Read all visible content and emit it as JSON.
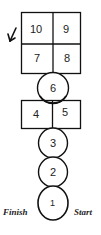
{
  "diagram": {
    "type": "hopscotch-court",
    "squares": [
      {
        "id": "10",
        "label": "10"
      },
      {
        "id": "9",
        "label": "9"
      },
      {
        "id": "7",
        "label": "7"
      },
      {
        "id": "8",
        "label": "8"
      },
      {
        "id": "4",
        "label": "4"
      },
      {
        "id": "5",
        "label": "5"
      }
    ],
    "circles": [
      {
        "id": "6",
        "label": "6"
      },
      {
        "id": "3",
        "label": "3"
      },
      {
        "id": "2",
        "label": "2"
      },
      {
        "id": "1",
        "label": "1"
      }
    ],
    "labels": {
      "finish": "Finish",
      "start": "Start"
    },
    "arrow": {
      "icon": "arrow-down-left-icon",
      "direction": "down-left"
    },
    "colors": {
      "stroke": "#111111",
      "background": "#ffffff"
    }
  }
}
